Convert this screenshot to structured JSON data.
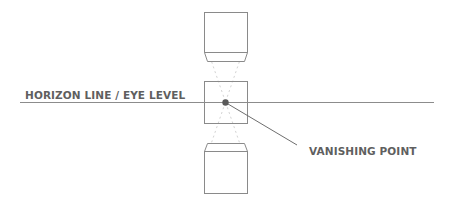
{
  "diagram": {
    "labels": {
      "horizon": "HORIZON LINE / EYE LEVEL",
      "vanishing_point": "VANISHING POINT"
    },
    "colors": {
      "line": "#8c8c8c",
      "box_stroke": "#8a8a8a",
      "dot": "#5a5a5a",
      "dashed": "#d0d0d0",
      "text": "#5f5f5f",
      "background": "#ffffff"
    },
    "elements": [
      {
        "name": "top-box",
        "shape": "box-with-bottom-bevel",
        "position": "above horizon"
      },
      {
        "name": "middle-square",
        "shape": "square",
        "position": "on horizon"
      },
      {
        "name": "bottom-box",
        "shape": "box-with-top-bevel",
        "position": "below horizon"
      },
      {
        "name": "horizon-line",
        "shape": "horizontal line"
      },
      {
        "name": "vanishing-point",
        "shape": "dot",
        "position": "center of middle square on horizon"
      },
      {
        "name": "convergence-lines",
        "shape": "dashed lines converging to vanishing point"
      },
      {
        "name": "leader-line",
        "shape": "line from vanishing point to label"
      }
    ]
  }
}
